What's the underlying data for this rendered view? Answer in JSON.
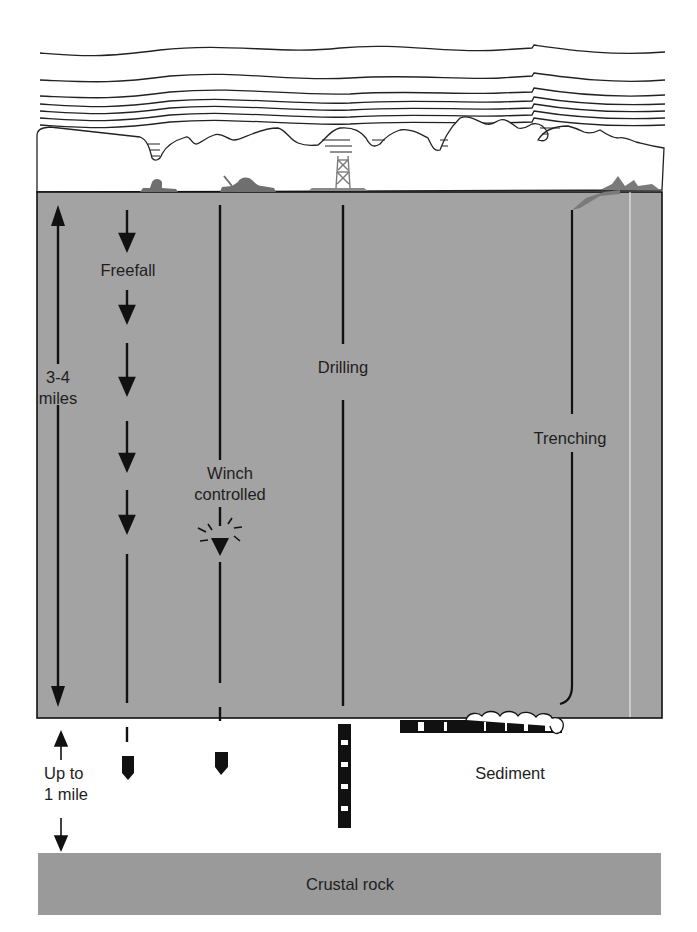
{
  "diagram": {
    "colors": {
      "ocean": "#a3a3a3",
      "crust": "#9a9a9a",
      "ink": "#111111",
      "ship": "#6f6f6f",
      "background": "#ffffff"
    },
    "layers": {
      "atmosphere": {
        "description": "wavy cloud/air layers above sea surface"
      },
      "ocean": {
        "label": ""
      },
      "sediment": {
        "label": "Sediment"
      },
      "crust": {
        "label": "Crustal rock"
      }
    },
    "depth_labels": {
      "ocean_depth": {
        "line1": "3-4",
        "line2": "miles"
      },
      "sediment_depth": {
        "line1": "Up to",
        "line2": "1 mile"
      }
    },
    "methods": [
      {
        "id": "freefall",
        "label": "Freefall"
      },
      {
        "id": "winch",
        "label_line1": "Winch",
        "label_line2": "controlled"
      },
      {
        "id": "drilling",
        "label": "Drilling"
      },
      {
        "id": "trenching",
        "label": "Trenching"
      }
    ]
  }
}
